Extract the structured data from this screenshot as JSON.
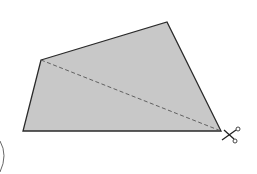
{
  "figure": {
    "shape": {
      "type": "quadrilateral",
      "fill": "#c8c8c8",
      "stroke": "#2a2a2a",
      "vertices": [
        [
          41,
          60
        ],
        [
          167,
          22
        ],
        [
          221,
          131
        ],
        [
          23,
          131
        ]
      ]
    },
    "cut_line": {
      "style": "dashed",
      "color": "#555555",
      "from": [
        41,
        60
      ],
      "to": [
        221,
        131
      ]
    },
    "scissors_icon": {
      "position": [
        232,
        136
      ],
      "color": "#222222"
    },
    "paren_label": ")"
  }
}
